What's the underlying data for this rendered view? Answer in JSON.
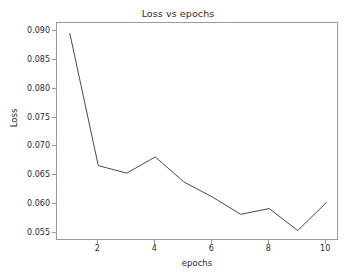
{
  "chart_data": {
    "type": "line",
    "title": "Loss vs epochs",
    "xlabel": "epochs",
    "ylabel": "Loss",
    "x": [
      1,
      2,
      3,
      4,
      5,
      6,
      7,
      8,
      9,
      10
    ],
    "values": [
      0.0895,
      0.0667,
      0.0654,
      0.0682,
      0.0639,
      0.0613,
      0.0583,
      0.0593,
      0.0555,
      0.0603
    ],
    "series": [
      {
        "name": "Loss",
        "values": [
          0.0895,
          0.0667,
          0.0654,
          0.0682,
          0.0639,
          0.0613,
          0.0583,
          0.0593,
          0.0555,
          0.0603
        ]
      }
    ],
    "xlim": [
      0.55,
      10.45
    ],
    "ylim": [
      0.0537,
      0.0913
    ],
    "xticks": [
      2,
      4,
      6,
      8,
      10
    ],
    "xtick_labels": [
      "2",
      "4",
      "6",
      "8",
      "10"
    ],
    "yticks": [
      0.055,
      0.06,
      0.065,
      0.07,
      0.075,
      0.08,
      0.085,
      0.09
    ],
    "ytick_labels": [
      "0.055",
      "0.060",
      "0.065",
      "0.070",
      "0.075",
      "0.080",
      "0.085",
      "0.090"
    ],
    "grid": false,
    "legend": null,
    "line_color": "#4a4a4a",
    "background_color": "#ffffff",
    "axis_color": "#9a9a9a",
    "text_color": "#2b2b2b"
  }
}
